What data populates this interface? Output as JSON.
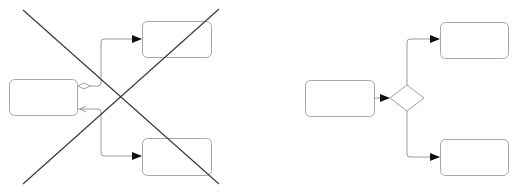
{
  "title": "",
  "colors": {
    "node_stroke": "#a8a8a8",
    "edge_stroke": "#9a9a9a",
    "cross_stroke": "#3a3a3a",
    "arrow_fill": "#111111"
  },
  "panels": [
    {
      "name": "incorrect-example",
      "crossed_out": true,
      "nodes": [
        {
          "id": "source",
          "label": ""
        },
        {
          "id": "target-top",
          "label": ""
        },
        {
          "id": "target-bottom",
          "label": ""
        }
      ],
      "edges": [
        {
          "from": "source",
          "to": "target-top",
          "source_marker": "small-diamond"
        },
        {
          "from": "source",
          "to": "target-bottom",
          "source_marker": "open-arrow"
        }
      ]
    },
    {
      "name": "correct-example",
      "crossed_out": false,
      "nodes": [
        {
          "id": "source",
          "label": ""
        },
        {
          "id": "decision",
          "label": "",
          "shape": "diamond"
        },
        {
          "id": "target-top",
          "label": ""
        },
        {
          "id": "target-bottom",
          "label": ""
        }
      ],
      "edges": [
        {
          "from": "source",
          "to": "decision"
        },
        {
          "from": "decision",
          "to": "target-top"
        },
        {
          "from": "decision",
          "to": "target-bottom"
        }
      ]
    }
  ]
}
